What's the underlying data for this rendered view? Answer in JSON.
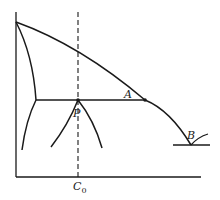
{
  "diagram": {
    "type": "phase-diagram",
    "stroke_color": "#1a1a1a",
    "labels": {
      "A": "A",
      "B": "B",
      "P": "P",
      "C0_main": "C",
      "C0_sub": "0"
    },
    "points": {
      "peak": [
        16,
        22
      ],
      "A": [
        145,
        100
      ],
      "P": [
        78,
        100
      ],
      "B": [
        191,
        145
      ],
      "tie_left": [
        36,
        100
      ]
    }
  }
}
